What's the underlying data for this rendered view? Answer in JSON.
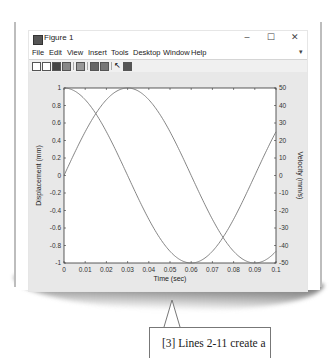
{
  "window": {
    "title": "Figure 1",
    "controls": {
      "minimize": "–",
      "maximize": "☐",
      "close": "✕"
    },
    "menu": [
      "File",
      "Edit",
      "View",
      "Insert",
      "Tools",
      "Desktop",
      "Window",
      "Help"
    ],
    "menu_overflow": "▾",
    "toolbar_icons": [
      "new-figure-icon",
      "open-file-icon",
      "save-icon",
      "print-icon",
      "zoom-icon",
      "link-icon",
      "insert-colorbar-icon",
      "pointer-icon",
      "show-plot-tools-icon"
    ]
  },
  "callout": {
    "text": "[3] Lines 2-11 create a"
  },
  "chart_data": {
    "type": "line",
    "title": "",
    "xlabel": "Time (sec)",
    "ylabel": "Displacement (mm)",
    "ylabel_right": "Velocity (mm/s)",
    "xlim": [
      0,
      0.1
    ],
    "ylim": [
      -1,
      1
    ],
    "ylim_right": [
      -50,
      50
    ],
    "grid": false,
    "legend": null,
    "x_ticks": [
      "0",
      "0.01",
      "0.02",
      "0.03",
      "0.04",
      "0.05",
      "0.06",
      "0.07",
      "0.08",
      "0.09",
      "0.1"
    ],
    "y_ticks": [
      "-1",
      "-0.8",
      "-0.6",
      "-0.4",
      "-0.2",
      "0",
      "0.2",
      "0.4",
      "0.6",
      "0.8",
      "1"
    ],
    "y_ticks_right": [
      "-50",
      "-40",
      "-30",
      "-20",
      "-10",
      "0",
      "10",
      "20",
      "30",
      "40",
      "50"
    ],
    "x": [
      0,
      0.005,
      0.01,
      0.015,
      0.02,
      0.025,
      0.03,
      0.035,
      0.04,
      0.045,
      0.05,
      0.055,
      0.06,
      0.065,
      0.07,
      0.075,
      0.08,
      0.085,
      0.09,
      0.095,
      0.1
    ],
    "series": [
      {
        "name": "Displacement",
        "axis": "left",
        "values": [
          0,
          0.26,
          0.5,
          0.71,
          0.87,
          0.97,
          1.0,
          0.97,
          0.87,
          0.71,
          0.5,
          0.26,
          0,
          -0.26,
          -0.5,
          -0.71,
          -0.87,
          -0.97,
          -1.0,
          -0.97,
          -0.87
        ]
      },
      {
        "name": "Velocity",
        "axis": "right",
        "values": [
          50,
          48.3,
          43.3,
          35.4,
          25.0,
          12.9,
          0,
          -12.9,
          -25.0,
          -35.4,
          -43.3,
          -48.3,
          -50,
          -48.3,
          -43.3,
          -35.4,
          -25.0,
          -12.9,
          0,
          12.9,
          25.0
        ]
      }
    ],
    "line_color": "#777777"
  }
}
